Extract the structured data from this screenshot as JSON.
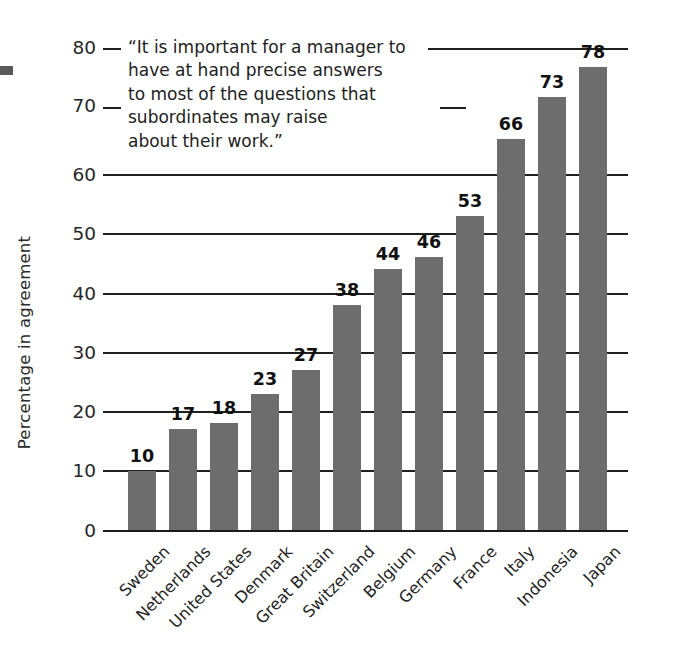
{
  "chart_data": {
    "type": "bar",
    "title": "",
    "xlabel": "",
    "ylabel": "Percentage in agreement",
    "ylim": [
      0,
      80
    ],
    "ytick_values": [
      0,
      10,
      20,
      30,
      40,
      50,
      60,
      70,
      80
    ],
    "ytick_labels": [
      "0",
      "10",
      "20",
      "30",
      "40",
      "50",
      "60",
      "70",
      "80"
    ],
    "grid": "horizontal",
    "legend": "none",
    "bar_color": "#6d6d6d",
    "categories": [
      "Sweden",
      "Netherlands",
      "United States",
      "Denmark",
      "Great Britain",
      "Switzerland",
      "Belgium",
      "Germany",
      "France",
      "Italy",
      "Indonesia",
      "Japan"
    ],
    "values": [
      10,
      17,
      18,
      23,
      27,
      38,
      44,
      46,
      53,
      66,
      73,
      78
    ],
    "data_labels": [
      "10",
      "17",
      "18",
      "23",
      "27",
      "38",
      "44",
      "46",
      "53",
      "66",
      "73",
      "78"
    ],
    "annotation": {
      "name": "quote-annotation",
      "lines": [
        "“It is important for a manager to",
        "have at hand precise answers",
        "to most of the questions that",
        "subordinates may raise",
        "about their work.”"
      ]
    }
  }
}
